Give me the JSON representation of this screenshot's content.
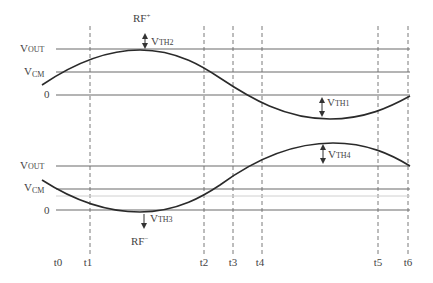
{
  "diagram": {
    "colors": {
      "curve": "#2a2a2a",
      "level_line": "#6a6a6a",
      "dashed_line": "#7a7a7a",
      "text": "#444444"
    },
    "upper_plot": {
      "peak_label": "RF",
      "peak_label_sup": "+",
      "levels": [
        {
          "name": "V",
          "sub": "OUT",
          "id": "vout"
        },
        {
          "name": "V",
          "sub": "CM",
          "id": "vcm"
        },
        {
          "name": "0",
          "sub": "",
          "id": "zero"
        }
      ],
      "thresholds": [
        {
          "name": "V",
          "sub": "TH2",
          "position": "above peak at V_OUT"
        },
        {
          "name": "V",
          "sub": "TH1",
          "position": "between 0 and trough"
        }
      ]
    },
    "lower_plot": {
      "trough_label": "RF",
      "trough_label_sup": "−",
      "levels": [
        {
          "name": "V",
          "sub": "OUT",
          "id": "vout"
        },
        {
          "name": "V",
          "sub": "CM",
          "id": "vcm"
        },
        {
          "name": "0",
          "sub": "",
          "id": "zero"
        }
      ],
      "thresholds": [
        {
          "name": "V",
          "sub": "TH3",
          "position": "below trough at 0"
        },
        {
          "name": "V",
          "sub": "TH4",
          "position": "between peak and V_OUT"
        }
      ]
    },
    "time_markers": [
      "t0",
      "t1",
      "t2",
      "t3",
      "t4",
      "t5",
      "t6"
    ]
  }
}
